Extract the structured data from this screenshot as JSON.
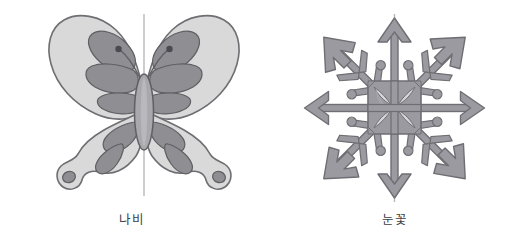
{
  "page": {
    "background_color": "#ffffff",
    "width": 526,
    "height": 249
  },
  "palette": {
    "wing_fill": "#d9d9d9",
    "wing_stroke": "#6e6e73",
    "spot_fill": "#8e8e93",
    "spot_stroke": "#5f5f64",
    "body_fill": "#a8a8ad",
    "body_stroke": "#5f5f64",
    "axis_line": "#b3b3b8",
    "snowflake_fill": "#9a9aa0",
    "snowflake_stroke": "#6e6e73",
    "caption_color": "#3f3f44"
  },
  "figures": [
    {
      "id": "butterfly",
      "caption": "나비",
      "symmetry_axis": "vertical",
      "symmetry_axis_count": 1,
      "parts": [
        "left-upper-wing",
        "right-upper-wing",
        "left-lower-wing",
        "right-lower-wing",
        "body",
        "left-antenna",
        "right-antenna"
      ]
    },
    {
      "id": "snowflake",
      "caption": "눈꽃",
      "symmetry_axis": "radial",
      "symmetry_axis_count": 6,
      "arm_count": 6,
      "parts": [
        "vertical-axis-line",
        "horizontal-axis-line",
        "arrow-arm-up",
        "arrow-arm-down",
        "arrow-arm-left",
        "arrow-arm-right",
        "arrow-arm-upper-left",
        "arrow-arm-upper-right",
        "arrow-arm-lower-left",
        "arrow-arm-lower-right",
        "center-lattice"
      ]
    }
  ]
}
